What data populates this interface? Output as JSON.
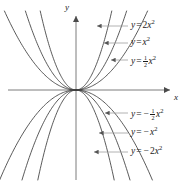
{
  "figure": {
    "width": 191,
    "height": 182,
    "background": "#ffffff",
    "curve_color": "#3c3c3c",
    "axis_color": "#6e6e6e",
    "leader_color": "#9a9a9a",
    "text_color": "#1a1a1a"
  },
  "axes": {
    "x_label": "x",
    "y_label": "y",
    "origin": {
      "x": 76,
      "y": 90
    },
    "x_axis": {
      "x1": 8,
      "y1": 90,
      "x2": 174,
      "y2": 90,
      "arrow": "right"
    },
    "y_axis": {
      "x1": 76,
      "y1": 11,
      "x2": 76,
      "y2": 180,
      "arrow": "up"
    },
    "ticks": false,
    "grid": false
  },
  "chart_data": {
    "type": "line",
    "title": "",
    "xlabel": "x",
    "ylabel": "y",
    "grid": false,
    "legend": "inline-callouts",
    "xlim": [
      -2.2,
      2.2
    ],
    "ylim": [
      -2.3,
      2.1
    ],
    "series": [
      {
        "name": "y = 2x^2",
        "label_plain": "y = 2x²",
        "coefficient": 2,
        "opens": "up",
        "x": [
          -1.0,
          -0.8,
          -0.6,
          -0.4,
          -0.2,
          0,
          0.2,
          0.4,
          0.6,
          0.8,
          1.0
        ],
        "y": [
          2.0,
          1.28,
          0.72,
          0.32,
          0.08,
          0,
          0.08,
          0.32,
          0.72,
          1.28,
          2.0
        ]
      },
      {
        "name": "y = x^2",
        "label_plain": "y = x²",
        "coefficient": 1,
        "opens": "up",
        "x": [
          -1.42,
          -1.2,
          -1.0,
          -0.8,
          -0.6,
          -0.4,
          -0.2,
          0,
          0.2,
          0.4,
          0.6,
          0.8,
          1.0,
          1.2,
          1.42
        ],
        "y": [
          2.0,
          1.44,
          1.0,
          0.64,
          0.36,
          0.16,
          0.04,
          0,
          0.04,
          0.16,
          0.36,
          0.64,
          1.0,
          1.44,
          2.0
        ]
      },
      {
        "name": "y = (1/2)x^2",
        "label_plain": "y = ½x²",
        "coefficient": 0.5,
        "opens": "up",
        "x": [
          -2.0,
          -1.6,
          -1.2,
          -0.8,
          -0.4,
          0,
          0.4,
          0.8,
          1.2,
          1.6,
          2.0
        ],
        "y": [
          2.0,
          1.28,
          0.72,
          0.32,
          0.08,
          0,
          0.08,
          0.32,
          0.72,
          1.28,
          2.0
        ]
      },
      {
        "name": "y = -(1/2)x^2",
        "label_plain": "y = −½x²",
        "coefficient": -0.5,
        "opens": "down",
        "x": [
          -2.1,
          -1.6,
          -1.2,
          -0.8,
          -0.4,
          0,
          0.4,
          0.8,
          1.2,
          1.6,
          2.1
        ],
        "y": [
          -2.2,
          -1.28,
          -0.72,
          -0.32,
          -0.08,
          0,
          -0.08,
          -0.32,
          -0.72,
          -1.28,
          -2.2
        ]
      },
      {
        "name": "y = -x^2",
        "label_plain": "y = −x²",
        "coefficient": -1,
        "opens": "down",
        "x": [
          -1.48,
          -1.2,
          -1.0,
          -0.8,
          -0.6,
          -0.4,
          -0.2,
          0,
          0.2,
          0.4,
          0.6,
          0.8,
          1.0,
          1.2,
          1.48
        ],
        "y": [
          -2.2,
          -1.44,
          -1.0,
          -0.64,
          -0.36,
          -0.16,
          -0.04,
          0,
          -0.04,
          -0.16,
          -0.36,
          -0.64,
          -1.0,
          -1.44,
          -2.2
        ]
      },
      {
        "name": "y = -2x^2",
        "label_plain": "y = −2x²",
        "coefficient": -2,
        "opens": "down",
        "x": [
          -1.05,
          -0.8,
          -0.6,
          -0.4,
          -0.2,
          0,
          0.2,
          0.4,
          0.6,
          0.8,
          1.05
        ],
        "y": [
          -2.2,
          -1.28,
          -0.72,
          -0.32,
          -0.08,
          0,
          -0.08,
          -0.32,
          -0.72,
          -1.28,
          -2.2
        ]
      }
    ]
  },
  "callouts": [
    {
      "id": "label-2x2",
      "y_text": "y",
      "eq": "=",
      "coef": "2",
      "var": "x",
      "exp": "2",
      "minus": "",
      "fraction": null,
      "label_x": 131,
      "label_y": 21,
      "leader": {
        "x1": 128,
        "y1": 26,
        "x2": 97,
        "y2": 26
      }
    },
    {
      "id": "label-x2",
      "y_text": "y",
      "eq": "=",
      "coef": "",
      "var": "x",
      "exp": "2",
      "minus": "",
      "fraction": null,
      "label_x": 131,
      "label_y": 38,
      "leader": {
        "x1": 128,
        "y1": 43,
        "x2": 104,
        "y2": 43
      }
    },
    {
      "id": "label-half-x2",
      "y_text": "y",
      "eq": "=",
      "coef": "",
      "var": "x",
      "exp": "2",
      "minus": "",
      "fraction": {
        "num": "1",
        "den": "2"
      },
      "label_x": 131,
      "label_y": 55,
      "leader": {
        "x1": 128,
        "y1": 60,
        "x2": 111,
        "y2": 60
      }
    },
    {
      "id": "label-neg-half-x2",
      "y_text": "y",
      "eq": "=",
      "coef": "",
      "var": "x",
      "exp": "2",
      "minus": "−",
      "fraction": {
        "num": "1",
        "den": "2"
      },
      "label_x": 131,
      "label_y": 108,
      "leader": {
        "x1": 128,
        "y1": 113,
        "x2": 105,
        "y2": 113
      }
    },
    {
      "id": "label-neg-x2",
      "y_text": "y",
      "eq": "=",
      "coef": "",
      "var": "x",
      "exp": "2",
      "minus": "−",
      "fraction": null,
      "label_x": 131,
      "label_y": 128,
      "leader": {
        "x1": 128,
        "y1": 133,
        "x2": 99,
        "y2": 133
      }
    },
    {
      "id": "label-neg-2x2",
      "y_text": "y",
      "eq": "=",
      "coef": "2",
      "var": "x",
      "exp": "2",
      "minus": "−",
      "fraction": null,
      "label_x": 131,
      "label_y": 147,
      "leader": {
        "x1": 128,
        "y1": 152,
        "x2": 94,
        "y2": 152
      }
    }
  ]
}
